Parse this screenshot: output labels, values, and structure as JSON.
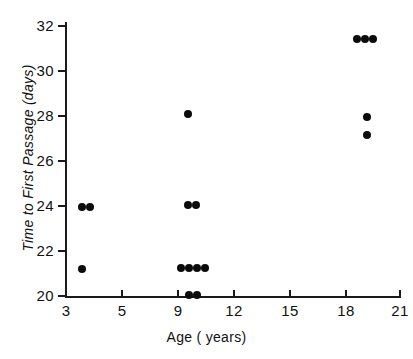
{
  "chart_data": {
    "type": "scatter",
    "title": "",
    "xlabel": "Age ( years)",
    "ylabel": "Time to First Passage (days)",
    "xlim": [
      2.0,
      22.0
    ],
    "ylim": [
      19.4,
      32.3
    ],
    "grid": false,
    "legend": null,
    "x_ticks": [
      {
        "label": "3",
        "value": 3,
        "px": 66
      },
      {
        "label": "5",
        "value": 5,
        "px": 122
      },
      {
        "label": "9",
        "value": 9,
        "px": 178
      },
      {
        "label": "12",
        "value": 12,
        "px": 234
      },
      {
        "label": "15",
        "value": 15,
        "px": 290
      },
      {
        "label": "18",
        "value": 18,
        "px": 346
      },
      {
        "label": "21",
        "value": 21,
        "px": 400
      }
    ],
    "y_ticks": [
      {
        "label": "32",
        "value": 32,
        "px": 26
      },
      {
        "label": "30",
        "value": 30,
        "px": 71
      },
      {
        "label": "28",
        "value": 28,
        "px": 116
      },
      {
        "label": "26",
        "value": 26,
        "px": 161
      },
      {
        "label": "24",
        "value": 24,
        "px": 206
      },
      {
        "label": "22",
        "value": 22,
        "px": 251
      },
      {
        "label": "20",
        "value": 20,
        "px": 296
      }
    ],
    "points": [
      {
        "x": 3.6,
        "y": 24.0,
        "px": 82,
        "py": 207
      },
      {
        "x": 3.9,
        "y": 24.0,
        "px": 90,
        "py": 207
      },
      {
        "x": 3.6,
        "y": 21.2,
        "px": 82,
        "py": 269
      },
      {
        "x": 9.7,
        "y": 28.1,
        "px": 188,
        "py": 114
      },
      {
        "x": 9.7,
        "y": 24.1,
        "px": 188,
        "py": 205
      },
      {
        "x": 10.0,
        "y": 24.1,
        "px": 196,
        "py": 205
      },
      {
        "x": 9.5,
        "y": 21.2,
        "px": 181,
        "py": 268
      },
      {
        "x": 9.8,
        "y": 21.2,
        "px": 189,
        "py": 268
      },
      {
        "x": 10.1,
        "y": 21.2,
        "px": 197,
        "py": 268
      },
      {
        "x": 10.4,
        "y": 21.2,
        "px": 205,
        "py": 268
      },
      {
        "x": 9.8,
        "y": 20.0,
        "px": 189,
        "py": 295
      },
      {
        "x": 10.1,
        "y": 20.0,
        "px": 197,
        "py": 295
      },
      {
        "x": 19.9,
        "y": 31.4,
        "px": 357,
        "py": 39
      },
      {
        "x": 20.2,
        "y": 31.4,
        "px": 365,
        "py": 39
      },
      {
        "x": 20.5,
        "y": 31.4,
        "px": 373,
        "py": 39
      },
      {
        "x": 20.3,
        "y": 28.0,
        "px": 367,
        "py": 117
      },
      {
        "x": 20.3,
        "y": 27.2,
        "px": 367,
        "py": 135
      }
    ],
    "series": [
      {
        "name": "observations",
        "x": [
          3.6,
          3.9,
          3.6,
          9.7,
          9.7,
          10.0,
          9.5,
          9.8,
          10.1,
          10.4,
          9.8,
          10.1,
          19.9,
          20.2,
          20.5,
          20.3,
          20.3
        ],
        "y": [
          24.0,
          24.0,
          21.2,
          28.1,
          24.1,
          24.1,
          21.2,
          21.2,
          21.2,
          21.2,
          20.0,
          20.0,
          31.4,
          31.4,
          31.4,
          28.0,
          27.2
        ]
      }
    ],
    "marker_color": "#0b0b0b",
    "marker": "filled-circle"
  }
}
